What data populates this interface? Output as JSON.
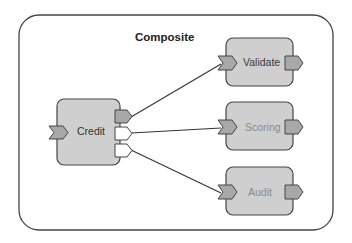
{
  "composite": {
    "title": "Composite"
  },
  "components": [
    {
      "id": "credit",
      "label": "Credit",
      "text_color": "#333333"
    },
    {
      "id": "validate",
      "label": "Validate",
      "text_color": "#3a3a3a"
    },
    {
      "id": "scoring",
      "label": "Scoring",
      "text_color": "#8a8a8a"
    },
    {
      "id": "audit",
      "label": "Audit",
      "text_color": "#8a8a8a"
    }
  ],
  "credit_references": [
    {
      "target": "validate",
      "state": "wired",
      "fill": "#a8a8a8"
    },
    {
      "target": "scoring",
      "state": "unwired",
      "fill": "#ffffff"
    },
    {
      "target": "audit",
      "state": "unwired",
      "fill": "#ffffff"
    }
  ],
  "colors": {
    "component_fill": "#cfcfcf",
    "port_fill": "#a8a8a8",
    "stroke": "#444444"
  }
}
